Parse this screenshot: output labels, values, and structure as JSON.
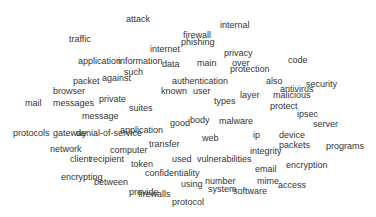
{
  "word_cloud": {
    "text_color": "#333333",
    "background": "#ffffff",
    "words": [
      {
        "text": "attack",
        "x": 126,
        "y": 15
      },
      {
        "text": "internal",
        "x": 220,
        "y": 21
      },
      {
        "text": "traffic",
        "x": 69,
        "y": 35
      },
      {
        "text": "firewall",
        "x": 183,
        "y": 31
      },
      {
        "text": "phishing",
        "x": 181,
        "y": 38
      },
      {
        "text": "internet",
        "x": 150,
        "y": 45
      },
      {
        "text": "privacy",
        "x": 224,
        "y": 49
      },
      {
        "text": "code",
        "x": 288,
        "y": 56
      },
      {
        "text": "application",
        "x": 78,
        "y": 57
      },
      {
        "text": "information",
        "x": 118,
        "y": 57
      },
      {
        "text": "data",
        "x": 162,
        "y": 60
      },
      {
        "text": "main",
        "x": 197,
        "y": 59
      },
      {
        "text": "over",
        "x": 232,
        "y": 59
      },
      {
        "text": "protection",
        "x": 230,
        "y": 65
      },
      {
        "text": "such",
        "x": 124,
        "y": 68
      },
      {
        "text": "packet",
        "x": 73,
        "y": 77
      },
      {
        "text": "against",
        "x": 102,
        "y": 74
      },
      {
        "text": "authentication",
        "x": 172,
        "y": 77
      },
      {
        "text": "also",
        "x": 266,
        "y": 77
      },
      {
        "text": "security",
        "x": 306,
        "y": 80
      },
      {
        "text": "antivirus",
        "x": 280,
        "y": 85
      },
      {
        "text": "malicious",
        "x": 273,
        "y": 91
      },
      {
        "text": "browser",
        "x": 53,
        "y": 87
      },
      {
        "text": "known",
        "x": 161,
        "y": 87
      },
      {
        "text": "user",
        "x": 193,
        "y": 87
      },
      {
        "text": "layer",
        "x": 240,
        "y": 91
      },
      {
        "text": "mail",
        "x": 25,
        "y": 99
      },
      {
        "text": "messages",
        "x": 53,
        "y": 99
      },
      {
        "text": "private",
        "x": 99,
        "y": 95
      },
      {
        "text": "types",
        "x": 214,
        "y": 97
      },
      {
        "text": "protect",
        "x": 270,
        "y": 102
      },
      {
        "text": "suites",
        "x": 129,
        "y": 104
      },
      {
        "text": "ipsec",
        "x": 297,
        "y": 110
      },
      {
        "text": "message",
        "x": 82,
        "y": 112
      },
      {
        "text": "good",
        "x": 170,
        "y": 119
      },
      {
        "text": "body",
        "x": 190,
        "y": 116
      },
      {
        "text": "malware",
        "x": 219,
        "y": 117
      },
      {
        "text": "server",
        "x": 313,
        "y": 120
      },
      {
        "text": "protocols",
        "x": 13,
        "y": 129
      },
      {
        "text": "gateway",
        "x": 53,
        "y": 129
      },
      {
        "text": "denial-of-service",
        "x": 76,
        "y": 129
      },
      {
        "text": "application",
        "x": 120,
        "y": 126
      },
      {
        "text": "web",
        "x": 202,
        "y": 134
      },
      {
        "text": "ip",
        "x": 253,
        "y": 131
      },
      {
        "text": "device",
        "x": 279,
        "y": 131
      },
      {
        "text": "transfer",
        "x": 149,
        "y": 140
      },
      {
        "text": "packets",
        "x": 279,
        "y": 141
      },
      {
        "text": "programs",
        "x": 326,
        "y": 142
      },
      {
        "text": "network",
        "x": 50,
        "y": 145
      },
      {
        "text": "computer",
        "x": 110,
        "y": 146
      },
      {
        "text": "integrity",
        "x": 250,
        "y": 147
      },
      {
        "text": "used",
        "x": 172,
        "y": 155
      },
      {
        "text": "vulnerabilities",
        "x": 197,
        "y": 155
      },
      {
        "text": "client",
        "x": 70,
        "y": 155
      },
      {
        "text": "recipient",
        "x": 90,
        "y": 155
      },
      {
        "text": "token",
        "x": 131,
        "y": 160
      },
      {
        "text": "email",
        "x": 255,
        "y": 165
      },
      {
        "text": "encryption",
        "x": 286,
        "y": 161
      },
      {
        "text": "encrypting",
        "x": 61,
        "y": 173
      },
      {
        "text": "between",
        "x": 94,
        "y": 178
      },
      {
        "text": "confidentiality",
        "x": 145,
        "y": 169
      },
      {
        "text": "using",
        "x": 181,
        "y": 180
      },
      {
        "text": "number",
        "x": 205,
        "y": 177
      },
      {
        "text": "system",
        "x": 208,
        "y": 185
      },
      {
        "text": "mime",
        "x": 257,
        "y": 177
      },
      {
        "text": "access",
        "x": 278,
        "y": 181
      },
      {
        "text": "software",
        "x": 233,
        "y": 187
      },
      {
        "text": "provide",
        "x": 129,
        "y": 188
      },
      {
        "text": "firewalls",
        "x": 138,
        "y": 190
      },
      {
        "text": "protocol",
        "x": 172,
        "y": 198
      }
    ]
  }
}
